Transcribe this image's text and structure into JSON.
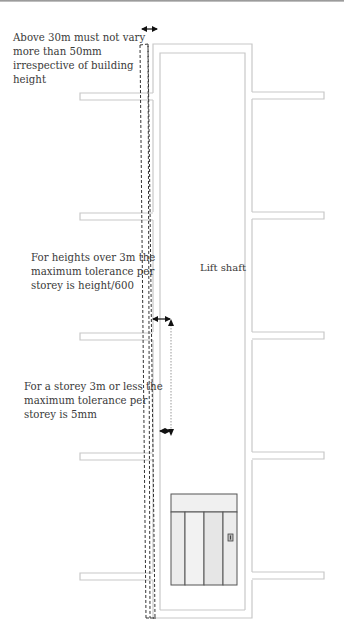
{
  "diagram": {
    "shaft_label": "Lift shaft",
    "annotations": [
      {
        "id": "above-30m",
        "text": "Above 30m must not vary\nmore than 50mm\nirrespective of building\nheight"
      },
      {
        "id": "over-3m",
        "text": "For heights over 3m the\nmaximum tolerance per\nstorey is height/600"
      },
      {
        "id": "under-3m",
        "text": "For a storey 3m or less the\nmaximum tolerance per\nstorey is 5mm"
      }
    ],
    "storeys": 5,
    "colors": {
      "wall_line": "#c8c8c8",
      "dashed_line": "#333333",
      "arrow": "#111111",
      "lift_car_fill": "#ececec",
      "lift_car_stroke": "#555555",
      "text": "#3a3a3a"
    }
  }
}
